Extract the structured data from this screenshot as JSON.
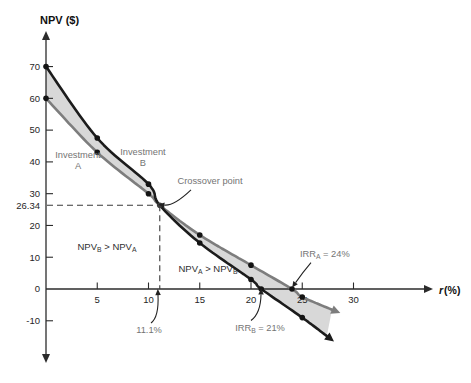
{
  "chart_data": {
    "type": "line",
    "title": "NPV ($)",
    "xlabel": "r (%)",
    "xlabel_var": "r",
    "xlabel_unit": "(%)",
    "ylabel": "NPV ($)",
    "x_ticks": [
      5,
      10,
      15,
      20,
      25,
      30
    ],
    "y_ticks": [
      70,
      60,
      50,
      40,
      30,
      20,
      10,
      0,
      -10
    ],
    "xlim": [
      0,
      33
    ],
    "ylim": [
      -16,
      75
    ],
    "grid": false,
    "legend_position": "none",
    "shade_color": "#d8d8d8",
    "series": [
      {
        "name": "Investment B",
        "color": "#1c1c1c",
        "points": [
          [
            0,
            70
          ],
          [
            5,
            47.5
          ],
          [
            10,
            33
          ],
          [
            11.1,
            26.34
          ],
          [
            15,
            14.5
          ],
          [
            20,
            3
          ],
          [
            21,
            0
          ],
          [
            25,
            -9
          ],
          [
            27.4,
            -14.8
          ]
        ],
        "marker_points": [
          [
            0,
            70
          ],
          [
            5,
            47.5
          ],
          [
            10,
            33
          ],
          [
            15,
            14.5
          ],
          [
            20,
            3
          ],
          [
            21,
            0
          ],
          [
            25,
            -9
          ]
        ],
        "irr_percent": 21
      },
      {
        "name": "Investment A",
        "color": "#7d7d7d",
        "points": [
          [
            0,
            60
          ],
          [
            5,
            43
          ],
          [
            10,
            30
          ],
          [
            11.1,
            26.34
          ],
          [
            15,
            17
          ],
          [
            20,
            7.5
          ],
          [
            24,
            0
          ],
          [
            25,
            -2.5
          ],
          [
            27.9,
            -6.5
          ]
        ],
        "marker_points": [
          [
            0,
            60
          ],
          [
            5,
            43
          ],
          [
            10,
            30
          ],
          [
            15,
            17
          ],
          [
            20,
            7.5
          ],
          [
            24,
            0
          ],
          [
            25,
            -2.5
          ]
        ],
        "irr_percent": 24
      }
    ],
    "crossover": {
      "r": 11.1,
      "npv": 26.34,
      "x_label": "11.1%",
      "y_label": "26.34"
    },
    "annotations": [
      {
        "id": "investment-a-label",
        "lines": [
          "Investment",
          "A"
        ],
        "x": 3.12,
        "y": 41.2,
        "color": "gray",
        "anchor": "middle"
      },
      {
        "id": "investment-b-label",
        "lines": [
          "Investment",
          "B"
        ],
        "x": 9.46,
        "y": 42.2,
        "color": "gray",
        "anchor": "middle"
      },
      {
        "id": "crossover-point-label",
        "parts": [
          {
            "t": "Crossover point"
          }
        ],
        "x": 16.0,
        "y": 33.0,
        "color": "gray",
        "anchor": "middle",
        "arrow": {
          "from": [
            14.15,
            31.2
          ],
          "ctrl": [
            12.49,
            26.1
          ],
          "to": [
            11.55,
            26.4
          ]
        }
      },
      {
        "id": "npv-b-greater-label",
        "parts": [
          {
            "t": "NPV"
          },
          {
            "t": "B",
            "sub": true
          },
          {
            "t": " > NPV"
          },
          {
            "t": "A",
            "sub": true
          }
        ],
        "x": 5.95,
        "y": 12.3,
        "color": "dark",
        "anchor": "middle"
      },
      {
        "id": "npv-a-greater-label",
        "parts": [
          {
            "t": "NPV"
          },
          {
            "t": "A",
            "sub": true
          },
          {
            "t": " > NPV"
          },
          {
            "t": "B",
            "sub": true
          }
        ],
        "x": 15.8,
        "y": 5.35,
        "color": "dark",
        "anchor": "middle"
      },
      {
        "id": "crossover-rate-label",
        "parts": [
          {
            "t": "11.1%"
          }
        ],
        "x": 10.05,
        "y": -13.85,
        "color": "gray",
        "anchor": "middle",
        "arrow": {
          "from": [
            10.24,
            -10.7
          ],
          "ctrl": [
            11.02,
            -8.8
          ],
          "to": [
            10.93,
            -1.9
          ]
        }
      },
      {
        "id": "irr-b-label",
        "parts": [
          {
            "t": "IRR"
          },
          {
            "t": "B",
            "sub": true
          },
          {
            "t": " = 21%"
          }
        ],
        "x": 20.88,
        "y": -13.2,
        "color": "gray",
        "anchor": "middle",
        "arrow": {
          "from": [
            20.0,
            -9.9
          ],
          "ctrl": [
            20.95,
            -7.6
          ],
          "to": [
            20.98,
            -1.7
          ]
        }
      },
      {
        "id": "irr-a-label",
        "parts": [
          {
            "t": "IRR"
          },
          {
            "t": "A",
            "sub": true
          },
          {
            "t": " = 24%"
          }
        ],
        "x": 27.2,
        "y": 10.1,
        "color": "gray",
        "anchor": "middle",
        "arrow": {
          "from": [
            25.85,
            8.3
          ],
          "ctrl": [
            25.07,
            5.35
          ],
          "to": [
            24.35,
            2.0
          ]
        }
      }
    ]
  }
}
